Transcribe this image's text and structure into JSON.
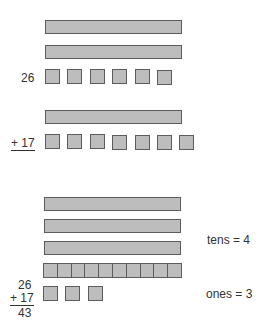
{
  "diagram": {
    "title": "",
    "colors": {
      "block_fill": "#bdbdbd",
      "block_border": "#5c5c5c",
      "text": "#333333"
    },
    "addend1": {
      "label": "26",
      "tens": 2,
      "ones": 6
    },
    "addend2": {
      "label": "+ 17",
      "tens": 1,
      "ones": 7
    },
    "result": {
      "tens_rods": 3,
      "regrouped_ten_segments": 10,
      "ones": 3,
      "tens_label": "tens = 4",
      "ones_label": "ones = 3",
      "equation": {
        "top": "26",
        "second": "+ 17",
        "sum": "43"
      }
    }
  }
}
